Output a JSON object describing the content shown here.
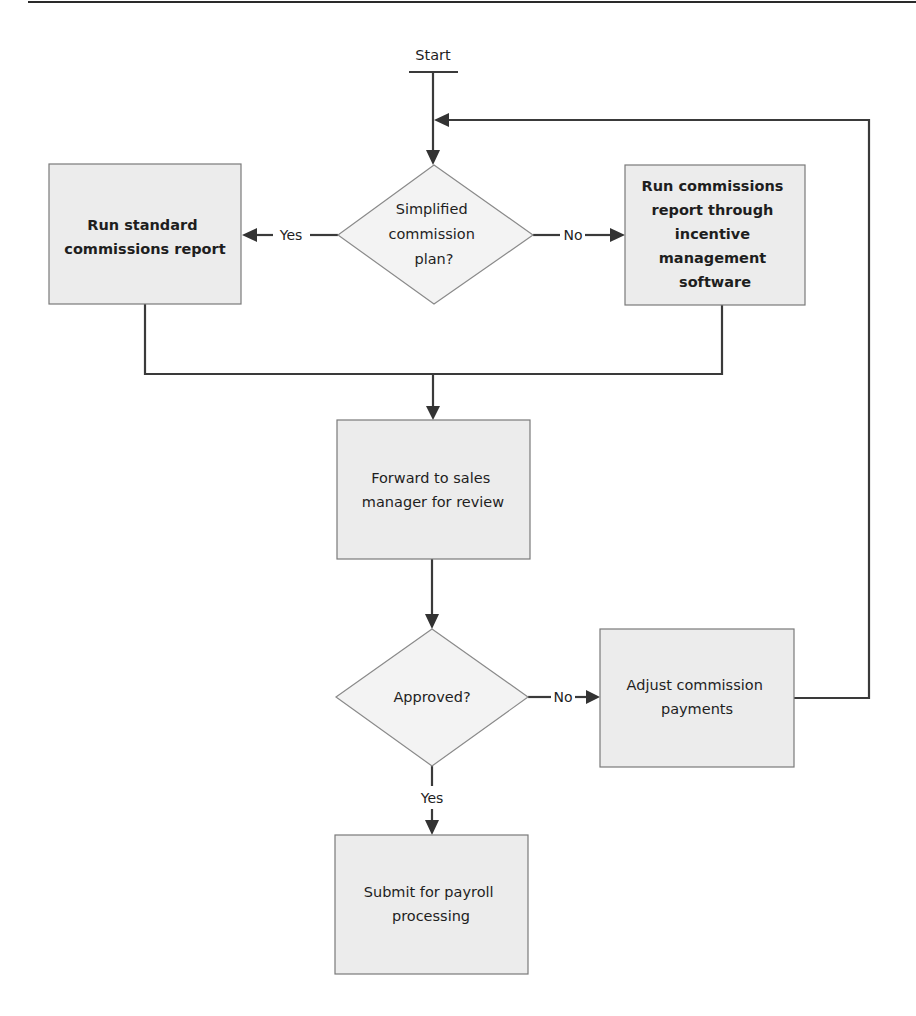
{
  "diagram": {
    "type": "flowchart",
    "start_label": "Start",
    "nodes": {
      "decision_plan": {
        "kind": "decision",
        "lines": [
          "Simplified",
          "commission",
          "plan?"
        ]
      },
      "standard_report": {
        "kind": "process",
        "bold": true,
        "lines": [
          "Run standard",
          "commissions report"
        ]
      },
      "incentive_report": {
        "kind": "process",
        "bold": true,
        "lines": [
          "Run commissions",
          "report through",
          "incentive",
          "management",
          "software"
        ]
      },
      "forward_review": {
        "kind": "process",
        "bold": false,
        "lines": [
          "Forward to sales",
          "manager for review"
        ]
      },
      "decision_approved": {
        "kind": "decision",
        "lines": [
          "Approved?"
        ]
      },
      "adjust_payments": {
        "kind": "process",
        "bold": false,
        "lines": [
          "Adjust commission",
          "payments"
        ]
      },
      "submit_payroll": {
        "kind": "process",
        "bold": false,
        "lines": [
          "Submit for payroll",
          "processing"
        ]
      }
    },
    "edges": [
      {
        "from": "start",
        "to": "decision_plan",
        "label": ""
      },
      {
        "from": "decision_plan",
        "to": "standard_report",
        "label": "Yes"
      },
      {
        "from": "decision_plan",
        "to": "incentive_report",
        "label": "No"
      },
      {
        "from": "standard_report",
        "to": "forward_review",
        "label": ""
      },
      {
        "from": "incentive_report",
        "to": "forward_review",
        "label": ""
      },
      {
        "from": "forward_review",
        "to": "decision_approved",
        "label": ""
      },
      {
        "from": "decision_approved",
        "to": "adjust_payments",
        "label": "No"
      },
      {
        "from": "decision_approved",
        "to": "submit_payroll",
        "label": "Yes"
      },
      {
        "from": "adjust_payments",
        "to": "decision_plan",
        "label": ""
      }
    ]
  }
}
